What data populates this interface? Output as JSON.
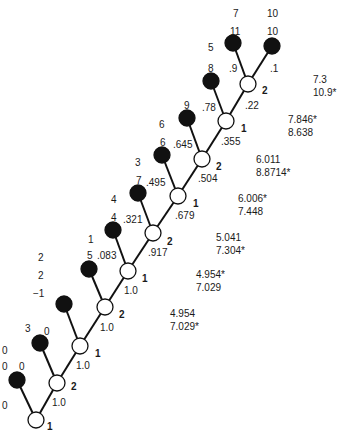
{
  "diagram": {
    "type": "tree",
    "open_nodes": [
      {
        "id": "n1a",
        "cx": 36,
        "cy": 420,
        "player": "1"
      },
      {
        "id": "n2a",
        "cx": 57,
        "cy": 383,
        "player": "2"
      },
      {
        "id": "n1b",
        "cx": 80,
        "cy": 346,
        "player": "1"
      },
      {
        "id": "n2b",
        "cx": 105,
        "cy": 307,
        "player": "2"
      },
      {
        "id": "n1c",
        "cx": 128,
        "cy": 271,
        "player": "1"
      },
      {
        "id": "n2c",
        "cx": 153,
        "cy": 233,
        "player": "2"
      },
      {
        "id": "n1d",
        "cx": 178,
        "cy": 196,
        "player": "1"
      },
      {
        "id": "n2d",
        "cx": 202,
        "cy": 159,
        "player": "2"
      },
      {
        "id": "n1e",
        "cx": 226,
        "cy": 121,
        "player": "1"
      },
      {
        "id": "n2e",
        "cx": 248,
        "cy": 84,
        "player": "2"
      }
    ],
    "terminal_nodes": [
      {
        "cx": 17,
        "cy": 380,
        "payoff_top": "0",
        "payoff_bottom": "0",
        "prob": "0"
      },
      {
        "cx": 40,
        "cy": 343,
        "payoff_top": "3",
        "payoff_bottom": "0",
        "prob": "0"
      },
      {
        "cx": 64,
        "cy": 304,
        "payoff_top": "−1",
        "payoff_bottom": "2",
        "prob": "0"
      },
      {
        "cx": 89,
        "cy": 269,
        "payoff_top": "2",
        "payoff_bottom": "5",
        "prob": ".083"
      },
      {
        "cx": 113,
        "cy": 230,
        "payoff_top": "1",
        "payoff_bottom": "4",
        "prob": ".321"
      },
      {
        "cx": 138,
        "cy": 193,
        "payoff_top": "4",
        "payoff_bottom": "7",
        "prob": ".495"
      },
      {
        "cx": 162,
        "cy": 155,
        "payoff_top": "3",
        "payoff_bottom": "6",
        "prob": ".645"
      },
      {
        "cx": 187,
        "cy": 118,
        "payoff_top": "6",
        "payoff_bottom": "9",
        "prob": ".78"
      },
      {
        "cx": 211,
        "cy": 81,
        "payoff_top": "5",
        "payoff_bottom": "8",
        "prob": ".9"
      },
      {
        "cx": 233,
        "cy": 43,
        "payoff_top": "8",
        "payoff_bottom": "11",
        "prob": ""
      },
      {
        "cx": 272,
        "cy": 46,
        "payoff_top": "7",
        "payoff_bottom": "10",
        "prob": ".1"
      }
    ],
    "top_labels": {
      "left_top": "7",
      "right_top": "10"
    },
    "continue_probs": [
      "1.0",
      "1.0",
      "1.0",
      "1.0",
      ".917",
      ".679",
      ".504",
      ".355",
      ".22"
    ],
    "scores": [
      {
        "line1": "7.3",
        "line2": "10.9*"
      },
      {
        "line1": "7.846*",
        "line2": "8.638"
      },
      {
        "line1": "6.011",
        "line2": "8.8714*"
      },
      {
        "line1": "6.006*",
        "line2": "7.448"
      },
      {
        "line1": "5.041",
        "line2": "7.304*"
      },
      {
        "line1": "4.954*",
        "line2": "7.029"
      },
      {
        "line1": "4.954",
        "line2": "7.029*"
      }
    ],
    "colors": {
      "line": "#111111",
      "terminal_fill": "#111111",
      "open_fill": "#ffffff"
    }
  }
}
